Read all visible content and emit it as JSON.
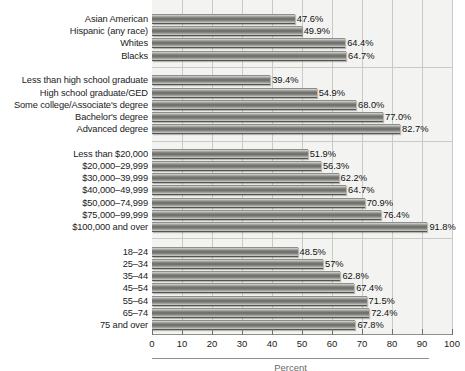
{
  "chart_data": {
    "type": "bar",
    "orientation": "horizontal",
    "title": "",
    "xlabel": "Percent",
    "ylabel": "",
    "xlim": [
      0,
      100
    ],
    "xticks": [
      0,
      10,
      20,
      30,
      40,
      50,
      60,
      70,
      80,
      90,
      100
    ],
    "xtick_labels": [
      "0",
      "10",
      "20",
      "30",
      "40",
      "50",
      "60",
      "70",
      "80",
      "90",
      "100"
    ],
    "grid": true,
    "legend": null,
    "value_suffix": "%",
    "groups": [
      {
        "name": "race-ethnicity",
        "categories": [
          "Asian American",
          "Hispanic (any race)",
          "Whites",
          "Blacks"
        ],
        "values": [
          47.6,
          49.9,
          64.4,
          64.7
        ],
        "labels": [
          "47.6%",
          "49.9%",
          "64.4%",
          "64.7%"
        ]
      },
      {
        "name": "education",
        "categories": [
          "Less than high school graduate",
          "High school graduate/GED",
          "Some college/Associate's degree",
          "Bachelor's degree",
          "Advanced degree"
        ],
        "values": [
          39.4,
          54.9,
          68.0,
          77.0,
          82.7
        ],
        "labels": [
          "39.4%",
          "54.9%",
          "68.0%",
          "77.0%",
          "82.7%"
        ]
      },
      {
        "name": "household-income",
        "categories": [
          "Less than $20,000",
          "$20,000–29,999",
          "$30,000–39,999",
          "$40,000–49,999",
          "$50,000–74,999",
          "$75,000–99,999",
          "$100,000 and over"
        ],
        "values": [
          51.9,
          56.3,
          62.2,
          64.7,
          70.9,
          76.4,
          91.8
        ],
        "labels": [
          "51.9%",
          "56.3%",
          "62.2%",
          "64.7%",
          "70.9%",
          "76.4%",
          "91.8%"
        ]
      },
      {
        "name": "age",
        "categories": [
          "18–24",
          "25–34",
          "35–44",
          "45–54",
          "55–64",
          "65–74",
          "75 and over"
        ],
        "values": [
          48.5,
          57.0,
          62.8,
          67.4,
          71.5,
          72.4,
          67.8
        ],
        "labels": [
          "48.5%",
          "57%",
          "62.8%",
          "67.4%",
          "71.5%",
          "72.4%",
          "67.8%"
        ]
      }
    ]
  },
  "colors": {
    "bar_light": "#d8d8d6",
    "bar_dark": "#6a6a67",
    "plot_background": "#f3f3f1",
    "gridline": "#c9c9c6",
    "text": "#1b1b1b"
  }
}
